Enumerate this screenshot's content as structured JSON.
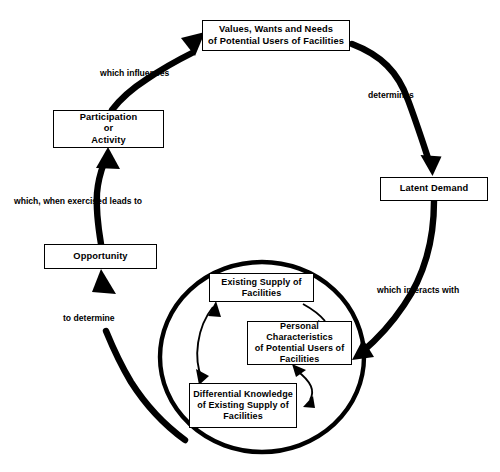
{
  "diagram": {
    "nodes": {
      "values": "Values, Wants and Needs\nof Potential Users of Facilities",
      "latent_demand": "Latent Demand",
      "opportunity": "Opportunity",
      "participation": "Participation\nor\nActivity",
      "existing_supply": "Existing Supply of\nFacilities",
      "personal_characteristics": "Personal Characteristics\nof Potential Users of\nFacilities",
      "differential_knowledge": "Differential Knowledge\nof Existing Supply of\nFacilities"
    },
    "edge_labels": {
      "determines": "determines",
      "which_interacts_with": "which interacts with",
      "to_determine": "to determine",
      "which_when_exercised_leads_to": "which, when exercised leads to",
      "which_influences": "which influences"
    },
    "colors": {
      "stroke": "#000000",
      "background": "#ffffff"
    }
  }
}
